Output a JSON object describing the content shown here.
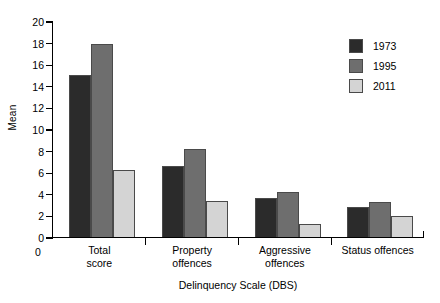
{
  "chart_data": {
    "type": "bar",
    "title": "",
    "xlabel": "Delinquency Scale (DBS)",
    "ylabel": "Mean",
    "categories": [
      "Total\nscore",
      "Property\noffences",
      "Aggressive\noffences",
      "Status offences"
    ],
    "category_lines": [
      [
        "Total",
        "score"
      ],
      [
        "Property",
        "offences"
      ],
      [
        "Aggressive",
        "offences"
      ],
      [
        "Status offences"
      ]
    ],
    "series": [
      {
        "name": "1973",
        "color": "#2b2b2b",
        "values": [
          15.1,
          6.7,
          3.7,
          2.9
        ]
      },
      {
        "name": "1995",
        "color": "#6e6e6e",
        "values": [
          18.0,
          8.2,
          4.3,
          3.3
        ]
      },
      {
        "name": "2011",
        "color": "#d4d4d4",
        "values": [
          6.3,
          3.4,
          1.3,
          2.0
        ]
      }
    ],
    "ylim": [
      0,
      20
    ],
    "yticks": [
      0,
      2,
      4,
      6,
      8,
      10,
      12,
      14,
      16,
      18,
      20
    ],
    "x_origin_label": "0",
    "grid": false,
    "legend_position": "top-right"
  }
}
